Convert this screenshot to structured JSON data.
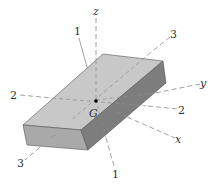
{
  "figure": {
    "colors": {
      "top_face": "#c8c8c8",
      "front_face": "#a9a9a9",
      "side_face": "#7d7d7d",
      "axis_line": "#8a8a8a",
      "text": "#333333",
      "point": "#000000"
    },
    "centroid_label": "G",
    "axis_labels": {
      "z": "z",
      "y": "y",
      "x": "x",
      "p1_top": "1",
      "p1_bottom": "1",
      "p2_left": "2",
      "p2_right": "2",
      "p3_top": "3",
      "p3_bottom": "3"
    }
  }
}
